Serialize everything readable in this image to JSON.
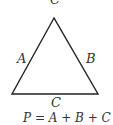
{
  "diagram": {
    "vertex_top_label": "C",
    "side_labels": {
      "left": "A",
      "right": "B",
      "bottom": "C"
    },
    "formula": "P = A + B + C",
    "stroke_color": "#222222"
  }
}
